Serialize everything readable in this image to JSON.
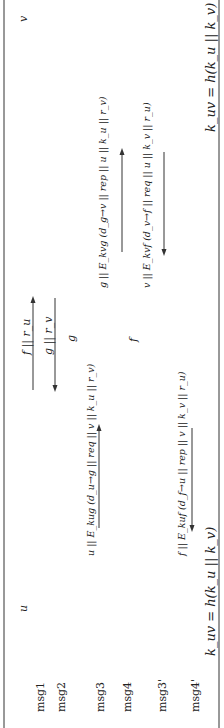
{
  "diagram": {
    "type": "protocol-sequence",
    "orientation": "rotated-90-ccw",
    "parties": [
      {
        "id": "u",
        "label": "u"
      },
      {
        "id": "v",
        "label": "v"
      }
    ],
    "messages": [
      {
        "id": "msg1",
        "label": "msg1",
        "content": "f||r_u",
        "direction": "u->v"
      },
      {
        "id": "msg2",
        "label": "msg2",
        "content": "g||r_v",
        "direction": "v->u"
      },
      {
        "id": "msg3",
        "label": "msg3",
        "u_side": "u||E_{k_ug}(d_{u→g}||req||v||k_u||r_v)",
        "v_side": "g||E_{k_vg}(d_{g→v}||rep||u||k_u||r_v)",
        "direction": "u->g->v"
      },
      {
        "id": "msg4",
        "label": "msg4",
        "mid": "f"
      },
      {
        "id": "msg3p",
        "label": "msg3'",
        "u_side": "f||E_{k_uf}(d_{f→u}||rep||v||k_v||r_u)",
        "v_side": "v||E_{k_vf}(d_{v→f}||req||u||k_v||r_u)",
        "direction": "v->f->u"
      },
      {
        "id": "msg4p",
        "label": "msg4'"
      }
    ],
    "labels": {
      "u": "u",
      "v": "v",
      "g": "g",
      "f": "f",
      "msg1": "msg1",
      "msg2": "msg2",
      "msg3": "msg3",
      "msg4": "msg4",
      "msg3p": "msg3'",
      "msg4p": "msg4'",
      "msg1_text": "f || r_u",
      "msg2_text": "g || r_v",
      "msg3_v": "g || E_kvg (d_g→v || rep || u || k_u || r_v)",
      "msg3_u": "u || E_kug (d_u→g || req || v || k_u || r_v)",
      "msg3p_v": "v || E_kvf (d_v→f || req || u || k_v || r_u)",
      "msg3p_u": "f || E_kuf (d_f→u || rep || v || k_v || r_u)",
      "key_u": "k_uv = h(k_u || k_v)",
      "key_v": "k_uv = h(k_u || k_v)"
    }
  }
}
